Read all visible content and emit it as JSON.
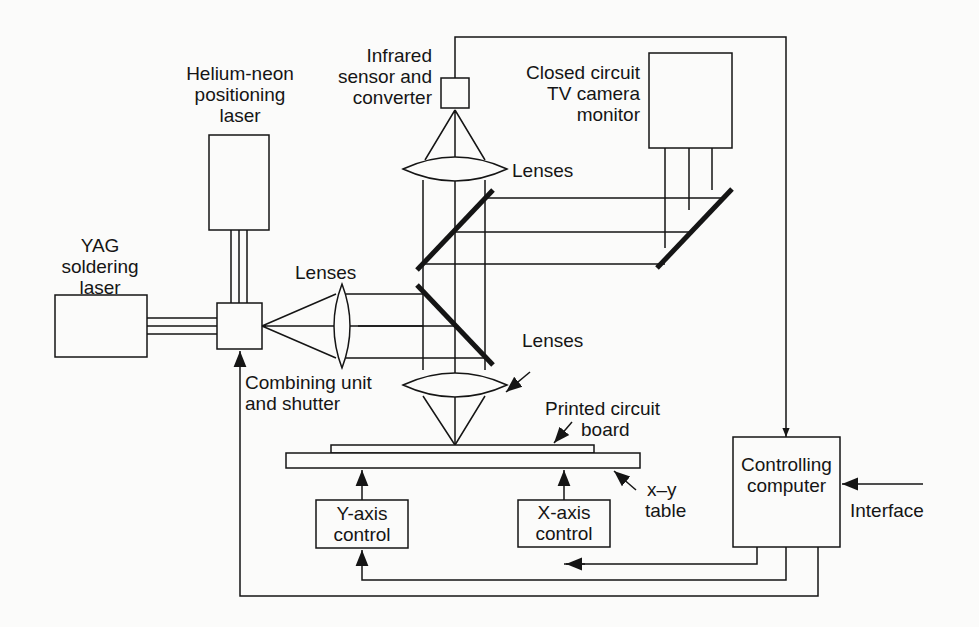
{
  "diagram": {
    "components": {
      "yag_laser": {
        "label_lines": [
          "YAG",
          "soldering",
          "laser"
        ]
      },
      "hene_laser": {
        "label_lines": [
          "Helium-neon",
          "positioning",
          "laser"
        ]
      },
      "infrared_sensor": {
        "label_lines": [
          "Infrared",
          "sensor and",
          "converter"
        ]
      },
      "cctv": {
        "label_lines": [
          "Closed circuit",
          "TV camera",
          "monitor"
        ]
      },
      "lenses_top": {
        "label": "Lenses"
      },
      "lenses_left": {
        "label": "Lenses"
      },
      "lenses_bottom": {
        "label": "Lenses"
      },
      "combining_unit": {
        "label_lines": [
          "Combining unit",
          "and shutter"
        ]
      },
      "pcb": {
        "label_lines": [
          "Printed circuit",
          "board"
        ]
      },
      "xy_table": {
        "label_lines": [
          "x–y",
          "table"
        ]
      },
      "y_axis_control": {
        "label_lines": [
          "Y-axis",
          "control"
        ]
      },
      "x_axis_control": {
        "label_lines": [
          "X-axis",
          "control"
        ]
      },
      "computer": {
        "label_lines": [
          "Controlling",
          "computer"
        ]
      },
      "interface": {
        "label": "Interface"
      }
    },
    "colors": {
      "ink": "#151515",
      "background": "#fbfbfa"
    }
  }
}
